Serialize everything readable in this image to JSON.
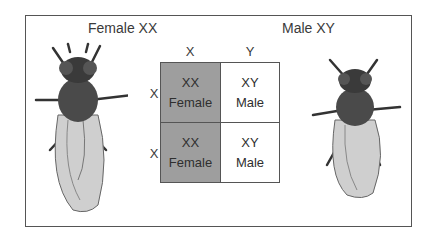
{
  "titles": {
    "female": "Female XX",
    "male": "Male XY"
  },
  "punnett": {
    "col_headers": [
      "X",
      "Y"
    ],
    "row_headers": [
      "X",
      "X"
    ],
    "cells": [
      {
        "genotype": "XX",
        "sex": "Female",
        "shaded": true
      },
      {
        "genotype": "XY",
        "sex": "Male",
        "shaded": false
      },
      {
        "genotype": "XX",
        "sex": "Female",
        "shaded": true
      },
      {
        "genotype": "XY",
        "sex": "Male",
        "shaded": false
      }
    ]
  },
  "colors": {
    "female_cell": "#9e9e9e",
    "male_cell": "#ffffff",
    "border": "#555555"
  },
  "images": {
    "left": "female-fruit-fly-illustration",
    "right": "male-fruit-fly-illustration"
  }
}
